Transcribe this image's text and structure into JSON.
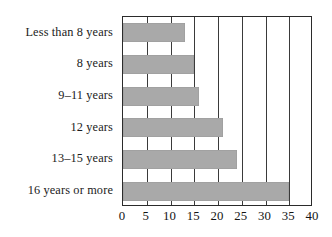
{
  "chart_data": {
    "type": "bar",
    "orientation": "horizontal",
    "title": "",
    "subtitle": "",
    "xlabel": "",
    "ylabel": "",
    "categories": [
      "Less than 8 years",
      "8 years",
      "9–11 years",
      "12 years",
      "13–15 years",
      "16 years or more"
    ],
    "values": [
      13,
      15,
      16,
      21,
      24,
      35
    ],
    "xlim": [
      0,
      40
    ],
    "ylim": null,
    "xticks": [
      0,
      5,
      10,
      15,
      20,
      25,
      30,
      35,
      40
    ],
    "xtick_labels": [
      "0",
      "5",
      "10",
      "15",
      "20",
      "25",
      "30",
      "35",
      "40"
    ],
    "grid": "vertical",
    "legend": null,
    "legend_position": "none",
    "annotations": [],
    "bar_color": "#a9a9a9",
    "frame_color": "#2b2b2b",
    "gridline_color": "#3a3a3a",
    "background": "#ffffff"
  }
}
